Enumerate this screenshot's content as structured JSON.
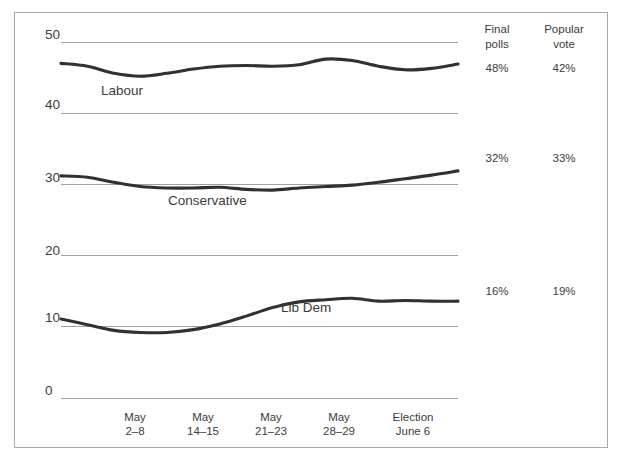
{
  "chart_data": {
    "type": "line",
    "title": "",
    "subtitle": "",
    "xlabel": "",
    "ylabel": "",
    "ylim": [
      0,
      50
    ],
    "yticks": [
      "0",
      "10",
      "20",
      "30",
      "40",
      "50"
    ],
    "grid": true,
    "grid_axis": "y",
    "legend": "inline-labels",
    "categories": [
      "May 2–8",
      "May 14–15",
      "May 21–23",
      "May 28–29",
      "Election June 6"
    ],
    "x": [
      0,
      1,
      2,
      3,
      4
    ],
    "series": [
      {
        "name": "Labour",
        "color": "#33302f",
        "values": [
          47.0,
          45.2,
          46.6,
          47.4,
          46.9
        ],
        "dense_values": [
          47.0,
          46.6,
          45.6,
          45.2,
          45.6,
          46.2,
          46.6,
          46.7,
          46.6,
          46.8,
          47.6,
          47.4,
          46.6,
          46.1,
          46.3,
          46.9
        ],
        "final_polls": "48%",
        "popular_vote": "42%"
      },
      {
        "name": "Conservative",
        "color": "#33302f",
        "values": [
          31.2,
          29.6,
          29.3,
          29.9,
          31.9
        ],
        "dense_values": [
          31.2,
          31.0,
          30.3,
          29.7,
          29.5,
          29.5,
          29.6,
          29.3,
          29.2,
          29.5,
          29.7,
          29.9,
          30.3,
          30.8,
          31.3,
          31.9
        ],
        "final_polls": "32%",
        "popular_vote": "33%"
      },
      {
        "name": "Lib Dem",
        "color": "#33302f",
        "values": [
          11.1,
          9.2,
          10.6,
          13.8,
          13.6
        ],
        "dense_values": [
          11.1,
          10.3,
          9.5,
          9.2,
          9.2,
          9.6,
          10.4,
          11.5,
          12.7,
          13.5,
          13.8,
          14.0,
          13.6,
          13.7,
          13.6,
          13.6
        ],
        "final_polls": "16%",
        "popular_vote": "19%"
      }
    ],
    "columns": {
      "final_polls": {
        "line1": "Final",
        "line2": "polls"
      },
      "popular_vote": {
        "line1": "Popular",
        "line2": "vote"
      }
    }
  },
  "ticks": {
    "y": [
      {
        "label": "50"
      },
      {
        "label": "40"
      },
      {
        "label": "30"
      },
      {
        "label": "20"
      },
      {
        "label": "10"
      },
      {
        "label": "0"
      }
    ],
    "x": [
      {
        "line1": "May",
        "line2": "2–8"
      },
      {
        "line1": "May",
        "line2": "14–15"
      },
      {
        "line1": "May",
        "line2": "21–23"
      },
      {
        "line1": "May",
        "line2": "28–29"
      },
      {
        "line1": "Election",
        "line2": "June 6"
      }
    ]
  },
  "series_labels": {
    "labour": "Labour",
    "conservative": "Conservative",
    "libdem": "Lib Dem"
  },
  "columns_header": {
    "final_line1": "Final",
    "final_line2": "polls",
    "popular_line1": "Popular",
    "popular_line2": "vote"
  },
  "values": {
    "labour_final": "48%",
    "labour_popular": "42%",
    "conservative_final": "32%",
    "conservative_popular": "33%",
    "libdem_final": "16%",
    "libdem_popular": "19%"
  },
  "colors": {
    "line": "#33302f",
    "grid": "#a0a0a0",
    "frame": "#a8a8a8",
    "text": "#3c3c3c",
    "background": "#ffffff"
  }
}
